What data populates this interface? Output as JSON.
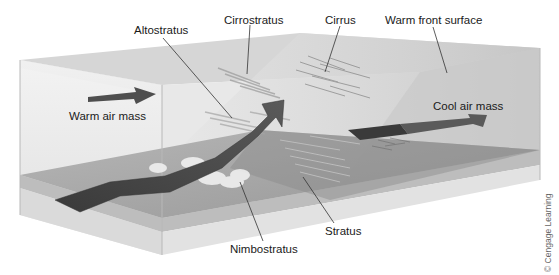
{
  "figure": {
    "labels": {
      "altostratus": "Altostratus",
      "cirrostratus": "Cirrostratus",
      "cirrus": "Cirrus",
      "warm_front_surface": "Warm front surface",
      "warm_air_mass": "Warm air mass",
      "cool_air_mass": "Cool air mass",
      "nimbostratus": "Nimbostratus",
      "stratus": "Stratus"
    },
    "credit": "© Cengage Learning"
  },
  "colors": {
    "box_face": "#e4e4e4",
    "box_top": "#d2d2d2",
    "floor": "#9c9c9c",
    "base_side": "#d8d8d8",
    "arrow": "#4a4a4a",
    "front_surface": "#c8c8c8",
    "leader_line": "#333333"
  }
}
